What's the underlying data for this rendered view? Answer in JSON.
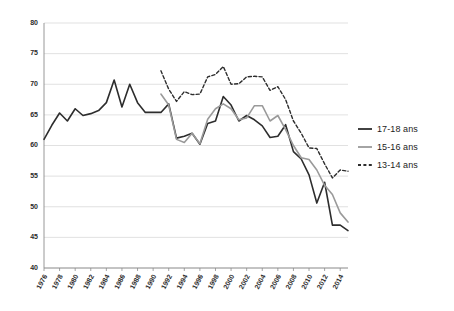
{
  "chart_data": {
    "type": "line",
    "title": "",
    "subtitle": "",
    "xlabel": "",
    "ylabel": "",
    "grid": true,
    "legend_position": "right",
    "xlim": [
      1976,
      2015
    ],
    "ylim": [
      40,
      80
    ],
    "yticks": [
      40,
      45,
      50,
      55,
      60,
      65,
      70,
      75,
      80
    ],
    "ytick_labels": [
      "40",
      "45",
      "50",
      "55",
      "60",
      "65",
      "70",
      "75",
      "80"
    ],
    "xticks": [
      1976,
      1978,
      1980,
      1982,
      1984,
      1986,
      1988,
      1990,
      1992,
      1994,
      1996,
      1998,
      2000,
      2002,
      2004,
      2006,
      2008,
      2010,
      2012,
      2014
    ],
    "xtick_labels": [
      "1976",
      "1978",
      "1980",
      "1982",
      "1984",
      "1986",
      "1988",
      "1990",
      "1992",
      "1994",
      "1996",
      "1998",
      "2000",
      "2002",
      "2004",
      "2006",
      "2008",
      "2010",
      "2012",
      "2014"
    ],
    "series": [
      {
        "name": "17-18 ans",
        "style": "solid",
        "color": "#2d2d2d",
        "width": 1.6,
        "x": [
          1976,
          1977,
          1978,
          1979,
          1980,
          1981,
          1982,
          1983,
          1984,
          1985,
          1986,
          1987,
          1988,
          1989,
          1990,
          1991,
          1992,
          1993,
          1994,
          1995,
          1996,
          1997,
          1998,
          1999,
          2000,
          2001,
          2002,
          2003,
          2004,
          2005,
          2006,
          2007,
          2008,
          2009,
          2010,
          2011,
          2012,
          2013,
          2014,
          2015
        ],
        "values": [
          61.0,
          63.3,
          65.3,
          64.0,
          66.0,
          64.9,
          65.2,
          65.7,
          67.0,
          70.7,
          66.3,
          70.0,
          67.0,
          65.4,
          65.4,
          65.4,
          66.8,
          61.2,
          61.5,
          62.0,
          60.2,
          63.6,
          64.0,
          68.0,
          66.6,
          64.0,
          64.9,
          64.2,
          63.2,
          61.3,
          61.5,
          63.4,
          59.0,
          57.8,
          55.2,
          50.6,
          54.0,
          47.0,
          47.0,
          46.1
        ]
      },
      {
        "name": "15-16 ans",
        "style": "solid",
        "color": "#9a9a9a",
        "width": 1.6,
        "x": [
          1991,
          1992,
          1993,
          1994,
          1995,
          1996,
          1997,
          1998,
          1999,
          2000,
          2001,
          2002,
          2003,
          2004,
          2005,
          2006,
          2007,
          2008,
          2009,
          2010,
          2011,
          2012,
          2013,
          2014,
          2015
        ],
        "values": [
          68.4,
          66.6,
          61.0,
          60.5,
          62.0,
          60.3,
          64.3,
          66.0,
          66.8,
          66.0,
          64.2,
          64.5,
          66.5,
          66.5,
          64.0,
          64.9,
          62.6,
          60.0,
          58.0,
          57.7,
          56.0,
          53.5,
          52.0,
          49.0,
          47.5
        ]
      },
      {
        "name": "13-14 ans",
        "style": "dashed",
        "color": "#2d2d2d",
        "width": 1.4,
        "x": [
          1991,
          1992,
          1993,
          1994,
          1995,
          1996,
          1997,
          1998,
          1999,
          2000,
          2001,
          2002,
          2003,
          2004,
          2005,
          2006,
          2007,
          2008,
          2009,
          2010,
          2011,
          2012,
          2013,
          2014,
          2015
        ],
        "values": [
          72.2,
          69.2,
          67.2,
          68.8,
          68.3,
          68.4,
          71.2,
          71.6,
          72.9,
          70.0,
          70.1,
          71.2,
          71.3,
          71.2,
          69.0,
          69.6,
          67.5,
          64.0,
          62.0,
          59.6,
          59.5,
          57.0,
          54.7,
          56.0,
          55.8
        ]
      }
    ]
  },
  "legend": {
    "items": [
      {
        "label": "17-18 ans",
        "swatch": "solid-dark-line-icon"
      },
      {
        "label": "15-16 ans",
        "swatch": "solid-gray-line-icon"
      },
      {
        "label": "13-14 ans",
        "swatch": "dashed-dark-line-icon"
      }
    ]
  }
}
